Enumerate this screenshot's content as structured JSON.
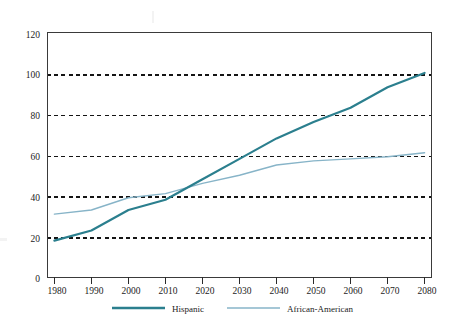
{
  "chart_data": {
    "type": "line",
    "title": "",
    "subtitle": "",
    "xlabel": "",
    "ylabel": "",
    "x": [
      1980,
      1990,
      2000,
      2010,
      2020,
      2030,
      2040,
      2050,
      2060,
      2070,
      2080
    ],
    "categories": [
      "1980",
      "1990",
      "2000",
      "2010",
      "2020",
      "2030",
      "2040",
      "2050",
      "2060",
      "2070",
      "2080"
    ],
    "series": [
      {
        "name": "Hispanic",
        "color": "#2b7f8e",
        "line_width": 2.2,
        "values": [
          18,
          23,
          33,
          38,
          48,
          58,
          68,
          76,
          83,
          93,
          100
        ]
      },
      {
        "name": "African-American",
        "color": "#87b4c8",
        "line_width": 1.4,
        "values": [
          31,
          33,
          39,
          41,
          46,
          50,
          55,
          57,
          58,
          59,
          61
        ]
      }
    ],
    "xlim": [
      1978,
      2082
    ],
    "ylim": [
      0,
      120
    ],
    "xticks": [
      1980,
      1990,
      2000,
      2010,
      2020,
      2030,
      2040,
      2050,
      2060,
      2070,
      2080
    ],
    "xtick_labels": [
      "1980",
      "1990",
      "2000",
      "2010",
      "2020",
      "2030",
      "2040",
      "2050",
      "2060",
      "2070",
      "2080"
    ],
    "yticks": [
      0,
      20,
      40,
      60,
      80,
      100,
      120
    ],
    "ytick_labels": [
      "0",
      "20",
      "40",
      "60",
      "80",
      "100",
      "120"
    ],
    "gridlines_y": [
      20,
      40,
      60,
      80,
      100
    ],
    "grid": "horizontal-dashed",
    "grid_color": "#141414",
    "legend_position": "bottom-center",
    "plot_border_color": "#3a3a3a",
    "background": "#ffffff"
  },
  "legend": {
    "entries": [
      {
        "label": "Hispanic",
        "color": "#2b7f8e"
      },
      {
        "label": "African-American",
        "color": "#87b4c8"
      }
    ]
  },
  "yaxis": {
    "labels": [
      "120",
      "100",
      "80",
      "60",
      "40",
      "20",
      "0"
    ]
  },
  "xaxis": {
    "labels": [
      "1980",
      "1990",
      "2000",
      "2010",
      "2020",
      "2030",
      "2040",
      "2050",
      "2060",
      "2070",
      "2080"
    ]
  }
}
